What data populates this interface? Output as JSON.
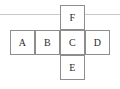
{
  "figure": {
    "kind": "cube-net-diagram",
    "canvas": {
      "width": 120,
      "height": 89,
      "background": "#ffffff"
    },
    "style": {
      "cell_border_color": "#8d8d8d",
      "cell_fill": "#ffffff",
      "label_color": "#2b2b2b",
      "rule_color": "#c9c9c9",
      "cell_size": 25
    },
    "rules": [
      {
        "name": "top-rule",
        "y": 14,
        "x": 0,
        "width": 120
      }
    ],
    "cells": [
      {
        "label": "F",
        "x": 60,
        "y": 5,
        "row": "top",
        "column": 3
      },
      {
        "label": "A",
        "x": 10,
        "y": 30,
        "row": "middle",
        "column": 1
      },
      {
        "label": "B",
        "x": 35,
        "y": 30,
        "row": "middle",
        "column": 2
      },
      {
        "label": "C",
        "x": 60,
        "y": 30,
        "row": "middle",
        "column": 3
      },
      {
        "label": "D",
        "x": 85,
        "y": 30,
        "row": "middle",
        "column": 4
      },
      {
        "label": "E",
        "x": 60,
        "y": 55,
        "row": "bottom",
        "column": 3
      }
    ]
  }
}
